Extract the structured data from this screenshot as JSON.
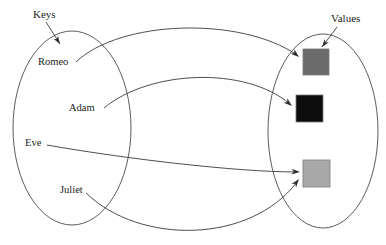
{
  "diagram": {
    "type": "key-value-mapping",
    "background_color": "#ffffff",
    "stroke_color": "#444444",
    "sets": {
      "keys": {
        "title": "Keys",
        "title_x": 33,
        "title_y": 18,
        "pointer_from_x": 46,
        "pointer_from_y": 22,
        "pointer_to_x": 60,
        "pointer_to_y": 44,
        "ellipse_cx": 72,
        "ellipse_cy": 128,
        "ellipse_rx": 59,
        "ellipse_ry": 97
      },
      "values": {
        "title": "Values",
        "title_x": 331,
        "title_y": 22,
        "pointer_from_x": 337,
        "pointer_from_y": 27,
        "pointer_to_x": 322,
        "pointer_to_y": 47,
        "ellipse_cx": 323,
        "ellipse_cy": 131,
        "ellipse_rx": 55,
        "ellipse_ry": 97
      }
    },
    "keys": [
      {
        "label": "Romeo",
        "x": 38,
        "y": 65,
        "anchor": "start"
      },
      {
        "label": "Adam",
        "x": 69,
        "y": 111,
        "anchor": "start"
      },
      {
        "label": "Eve",
        "x": 25,
        "y": 146,
        "anchor": "start"
      },
      {
        "label": "Juliet",
        "x": 60,
        "y": 193,
        "anchor": "start"
      }
    ],
    "values": [
      {
        "name": "dark-gray-value",
        "color": "#6b6b6b",
        "border_color": "#7a7a7a",
        "x": 303,
        "y": 49,
        "size": 26
      },
      {
        "name": "black-value",
        "color": "#0c0c0c",
        "border_color": "#6e6e6e",
        "x": 296,
        "y": 95,
        "size": 27
      },
      {
        "name": "light-gray-value",
        "color": "#a9a9a9",
        "border_color": "#b2b2b2",
        "x": 303,
        "y": 160,
        "size": 27
      }
    ],
    "mappings": [
      {
        "from": "Romeo",
        "to": "dark-gray-value",
        "path": "M 76 62 C 120 20 240 16 297 55",
        "head_x": 299,
        "head_y": 57,
        "head_angle": 40
      },
      {
        "from": "Adam",
        "to": "black-value",
        "path": "M 104 108 C 150 70 245 66 290 104",
        "head_x": 292,
        "head_y": 106,
        "head_angle": 40
      },
      {
        "from": "Eve",
        "to": "light-gray-value",
        "path": "M 47 145 C 120 158 235 172 297 172",
        "head_x": 300,
        "head_y": 172,
        "head_angle": 3
      },
      {
        "from": "Juliet",
        "to": "light-gray-value",
        "path": "M 86 193 C 140 245 250 244 297 182",
        "head_x": 299,
        "head_y": 179,
        "head_angle": -52
      }
    ]
  }
}
